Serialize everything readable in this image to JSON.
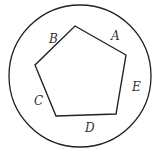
{
  "diagram": {
    "type": "pentagon inscribed region within circle",
    "circle": {
      "cx": 80,
      "cy": 76,
      "r": 71
    },
    "pentagon": {
      "points": [
        [
          75,
          26
        ],
        [
          126,
          55
        ],
        [
          116,
          114
        ],
        [
          56,
          116
        ],
        [
          35,
          65
        ]
      ]
    },
    "labels": [
      {
        "text": "A",
        "x": 111,
        "y": 40
      },
      {
        "text": "B",
        "x": 49,
        "y": 43
      },
      {
        "text": "C",
        "x": 34,
        "y": 105
      },
      {
        "text": "D",
        "x": 85,
        "y": 132
      },
      {
        "text": "E",
        "x": 132,
        "y": 91
      }
    ]
  }
}
